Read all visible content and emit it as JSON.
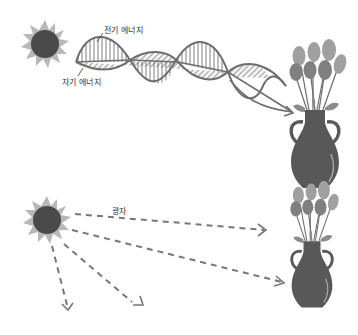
{
  "panels": [
    {
      "id": "wave-model",
      "labels": {
        "electric": "전기 에너지",
        "magnetic": "자기 에너지"
      }
    },
    {
      "id": "particle-model",
      "labels": {
        "photon": "광자"
      }
    }
  ],
  "colors": {
    "sun_core": "#4a4a4a",
    "sun_rays": "#b5b5b5",
    "wave_stroke": "#6e6e6e",
    "vase": "#5a5a5a",
    "flower_light": "#9a9a9a",
    "flower_dark": "#7a7a7a",
    "dashed_arrow": "#777777"
  }
}
